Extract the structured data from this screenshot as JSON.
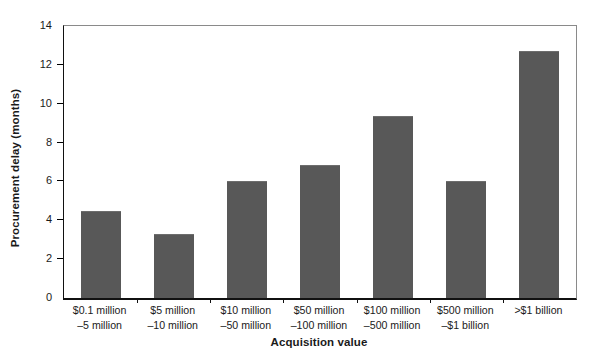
{
  "chart_data": {
    "type": "bar",
    "title": "",
    "xlabel": "Acquisition value",
    "ylabel": "Procurement delay (months)",
    "categories": [
      "$0.1 million –5 million",
      "$5 million –10 million",
      "$10 million –50 million",
      "$50 million –100 million",
      "$100 million –500 million",
      "$500 million –$1 billion",
      ">$1 billion"
    ],
    "category_lines": [
      [
        "$0.1 million",
        "–5 million"
      ],
      [
        "$5 million",
        "–10 million"
      ],
      [
        "$10 million",
        "–50 million"
      ],
      [
        "$50 million",
        "–100 million"
      ],
      [
        "$100 million",
        "–500 million"
      ],
      [
        "$500 million",
        "–$1 billion"
      ],
      [
        ">$1 billion",
        ""
      ]
    ],
    "values": [
      4.5,
      3.3,
      6.0,
      6.85,
      9.35,
      6.0,
      12.7
    ],
    "ylim": [
      0,
      14
    ],
    "yticks": [
      0,
      2,
      4,
      6,
      8,
      10,
      12,
      14
    ],
    "ytick_labels": [
      "0",
      "2",
      "4",
      "6",
      "8",
      "10",
      "12",
      "14"
    ],
    "grid": false,
    "legend": "none",
    "bar_color": "#585858",
    "axis_color": "#111111",
    "frame_color": "#8a8a8a"
  }
}
